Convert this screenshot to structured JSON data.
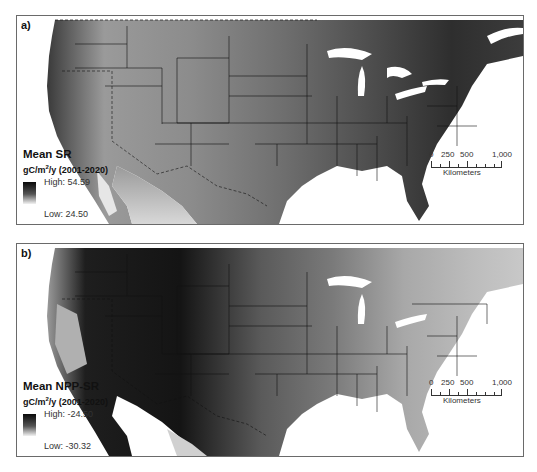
{
  "figure": {
    "region": "Contiguous United States",
    "panels": [
      {
        "id": "a",
        "label": "a)",
        "legend": {
          "title": "Mean SR",
          "unit_prefix": "gC/m",
          "unit_sup": "2",
          "unit_suffix": "/y (2001-2020)",
          "high_label": "High: 54.59",
          "low_label": "Low: 24.50",
          "high_value": 54.59,
          "low_value": 24.5,
          "ramp": [
            "#0a0a0a",
            "#f2f2f2"
          ]
        },
        "scalebar": {
          "ticks": [
            "0",
            "250",
            "500",
            "1,000"
          ],
          "units": "Kilometers"
        }
      },
      {
        "id": "b",
        "label": "b)",
        "legend": {
          "title": "Mean NPP-SR",
          "unit_prefix": "gC/m",
          "unit_sup": "2",
          "unit_suffix": "/y (2001-2020)",
          "high_label": "High: -24.50",
          "low_label": "Low: -30.32",
          "high_value": -24.5,
          "low_value": -30.32,
          "ramp": [
            "#0a0a0a",
            "#f2f2f2"
          ]
        },
        "scalebar": {
          "ticks": [
            "0",
            "250",
            "500",
            "1,000"
          ],
          "units": "Kilometers"
        }
      }
    ]
  }
}
